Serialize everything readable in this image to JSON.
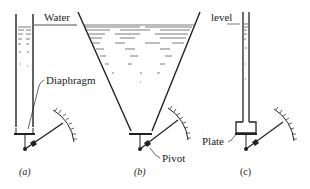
{
  "diagram": {
    "labels": {
      "water": "Water",
      "level": "level",
      "diaphragm": "Diaphragm",
      "pivot": "Pivot",
      "plate": "Plate"
    },
    "panels": [
      {
        "id": "a",
        "caption": "(a)",
        "vessel": "narrow tube"
      },
      {
        "id": "b",
        "caption": "(b)",
        "vessel": "wide tapered vessel"
      },
      {
        "id": "c",
        "caption": "(c)",
        "vessel": "narrow tube with widened base"
      }
    ],
    "colors": {
      "ink": "#222222",
      "background": "#ffffff"
    }
  }
}
